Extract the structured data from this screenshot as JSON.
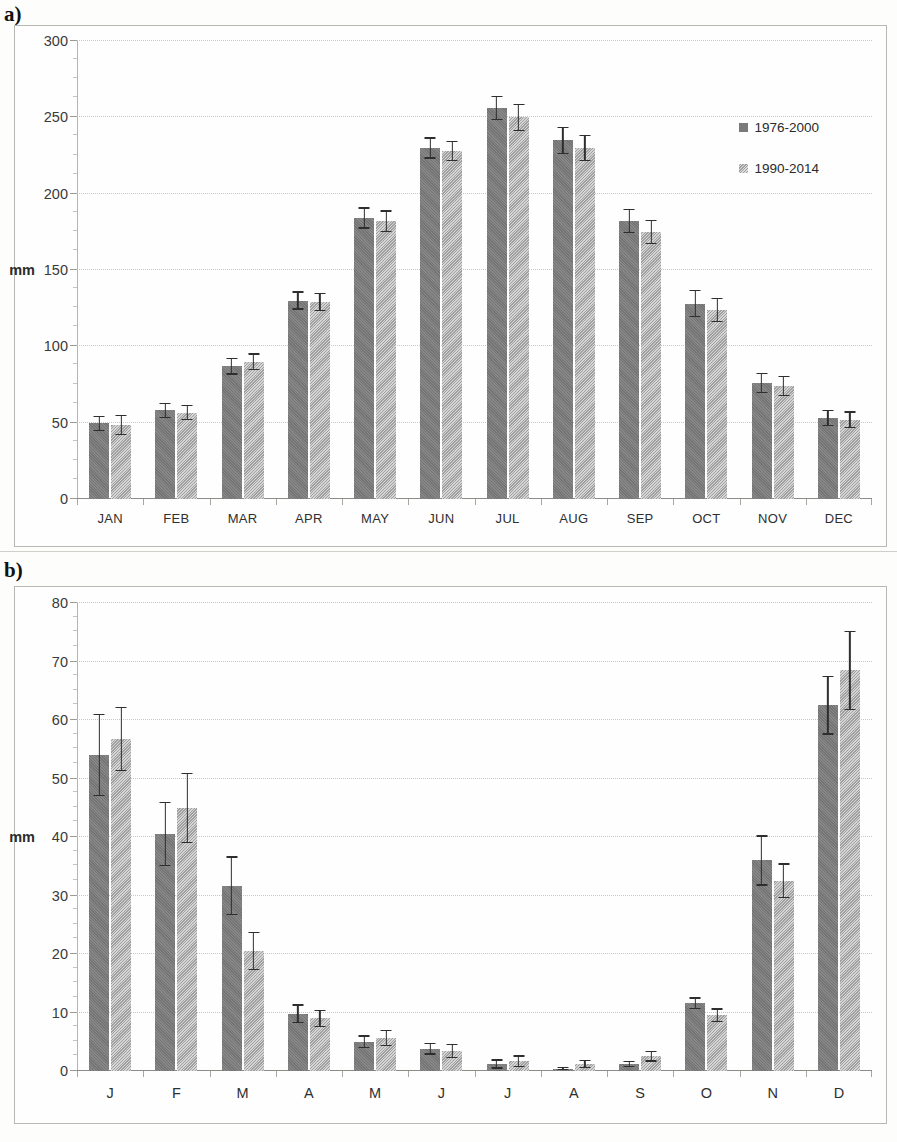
{
  "figure": {
    "panel_a_label": "a)",
    "panel_b_label": "b)"
  },
  "legend": {
    "series1": "1976-2000",
    "series2": "1990-2014",
    "swatch1_name": "legend-swatch-1976-2000",
    "swatch2_name": "legend-swatch-1990-2014"
  },
  "colors": {
    "series1": "#7a7a7a",
    "series2": "#b2b2b2",
    "grid": "#c9c9c4",
    "axis": "#8d8d88",
    "errorbar": "#2e2e2e"
  },
  "chart_data": [
    {
      "id": "panel-a",
      "type": "bar",
      "title": "a)",
      "xlabel": "",
      "ylabel": "mm",
      "ylim": [
        0,
        300
      ],
      "yticks": [
        0,
        50,
        100,
        150,
        200,
        250,
        300
      ],
      "ytick_labels": [
        "0",
        "50",
        "100",
        "150",
        "200",
        "250",
        "300"
      ],
      "grid": true,
      "legend_position": "upper right",
      "categories": [
        "JAN",
        "FEB",
        "MAR",
        "APR",
        "MAY",
        "JUN",
        "JUL",
        "AUG",
        "SEP",
        "OCT",
        "NOV",
        "DEC"
      ],
      "series": [
        {
          "name": "1976-2000",
          "color": "#7a7a7a",
          "values": [
            49.5,
            58.0,
            87.0,
            130.0,
            184.0,
            230.0,
            256.0,
            235.0,
            182.0,
            128.0,
            76.0,
            53.0
          ],
          "errors": [
            5.0,
            5.0,
            5.5,
            6.0,
            7.0,
            7.0,
            8.0,
            9.0,
            8.0,
            9.0,
            6.5,
            5.5
          ]
        },
        {
          "name": "1990-2014",
          "color": "#b2b2b2",
          "values": [
            48.5,
            56.5,
            90.0,
            129.0,
            182.0,
            228.0,
            250.0,
            230.0,
            175.0,
            124.0,
            74.0,
            52.0
          ],
          "errors": [
            6.5,
            5.0,
            5.5,
            6.0,
            7.0,
            6.5,
            9.0,
            8.5,
            8.0,
            8.0,
            6.5,
            5.5
          ]
        }
      ]
    },
    {
      "id": "panel-b",
      "type": "bar",
      "title": "b)",
      "xlabel": "",
      "ylabel": "mm",
      "ylim": [
        0,
        80
      ],
      "yticks": [
        0,
        10,
        20,
        30,
        40,
        50,
        60,
        70,
        80
      ],
      "ytick_labels": [
        "0",
        "10",
        "20",
        "30",
        "40",
        "50",
        "60",
        "70",
        "80"
      ],
      "grid": true,
      "legend_position": "upper right",
      "categories": [
        "J",
        "F",
        "M",
        "A",
        "M",
        "J",
        "J",
        "A",
        "S",
        "O",
        "N",
        "D"
      ],
      "series": [
        {
          "name": "1976-2000",
          "color": "#7a7a7a",
          "values": [
            54.0,
            40.5,
            31.7,
            9.8,
            5.0,
            3.8,
            1.2,
            0.4,
            1.2,
            11.6,
            36.0,
            62.5
          ],
          "errors": [
            7.0,
            5.5,
            5.0,
            1.6,
            1.1,
            1.0,
            0.8,
            0.3,
            0.5,
            1.0,
            4.3,
            5.0
          ]
        },
        {
          "name": "1990-2014",
          "color": "#b2b2b2",
          "values": [
            56.7,
            45.0,
            20.5,
            9.0,
            5.6,
            3.4,
            1.7,
            1.2,
            2.5,
            9.5,
            32.5,
            68.5
          ],
          "errors": [
            5.5,
            6.0,
            3.3,
            1.5,
            1.4,
            1.2,
            1.0,
            0.7,
            0.9,
            1.2,
            3.0,
            6.8
          ]
        }
      ]
    }
  ]
}
